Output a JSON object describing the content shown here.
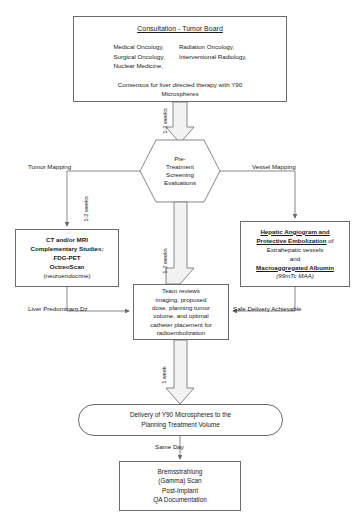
{
  "diagram": {
    "nodes": {
      "consultation": {
        "heading": "Consultation - Tumor Board",
        "left_column": [
          "Medical Oncology,",
          "Surgical Oncology,",
          "Nuclear Medicine,"
        ],
        "right_column": [
          "Radiation Oncology,",
          "Interventional Radiology,"
        ],
        "consensus_line1": "Consensus for liver directed therapy with Y90",
        "consensus_line2": "Microspheres"
      },
      "screening": {
        "lines": [
          "Pre-",
          "Treatment",
          "Screening",
          "Evaluations"
        ]
      },
      "imaging_studies": {
        "lines": [
          "CT and/or MRI",
          "Complementary Studies:",
          "FDG-PET",
          "OctreoScan",
          "(neuroendocrine)"
        ]
      },
      "angiogram": {
        "line1_bold": "Hepatic Angiogram and",
        "line2_bold": "Protective Embolization",
        "line2_plain": " of",
        "line3": "Extrahepatic vessels",
        "line4": "and",
        "line5_bold": "Macroaggregated Albumin",
        "line6": "(99mTc MAA)"
      },
      "team_review": {
        "lines": [
          "Team reviews",
          "imaging, proposed",
          "dose, planning tumor",
          "volume, and optimal",
          "catheter placement for",
          "radioembolization"
        ]
      },
      "delivery": {
        "line1": "Delivery of Y90 Microspheres to the",
        "line2": "Planning Treatment Volume"
      },
      "bremsstrahlung": {
        "lines": [
          "Bremsstrahlung",
          "(Gamma) Scan",
          "Post-Implant",
          "QA Documentation"
        ]
      }
    },
    "edge_labels": {
      "consult_to_screening": "1-2 weeks",
      "tumor_mapping": "Tumor Mapping",
      "vessel_mapping": "Vessel Mapping",
      "screening_to_team": "1-2 weeks",
      "imaging_to_team_side": "1-2 weeks",
      "liver_predominant": "Liver Predominant Dz",
      "safe_delivery": "Safe Delivery Achievable",
      "team_to_delivery": "1 week",
      "delivery_to_scan": "Same Day"
    },
    "colors": {
      "stroke": "#6b6b6b",
      "arrow_fill": "#f2f2f2",
      "text": "#1a1a1a",
      "background": "#ffffff"
    }
  }
}
